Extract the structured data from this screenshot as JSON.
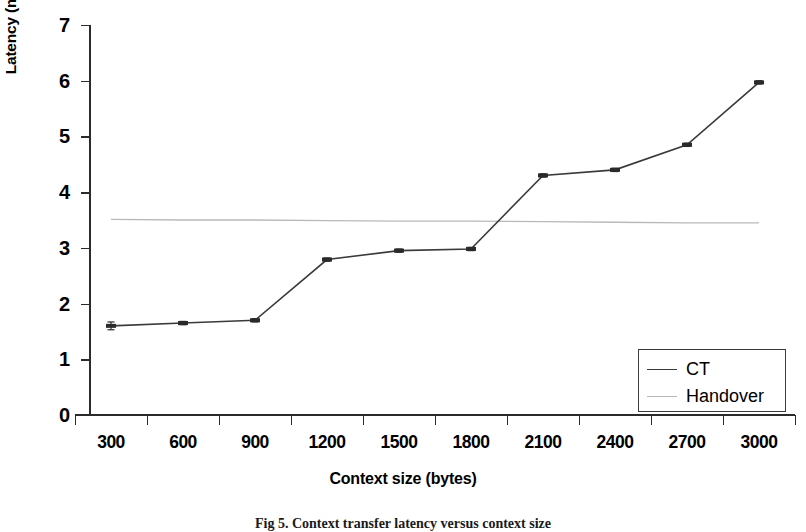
{
  "chart_data": {
    "type": "line",
    "title": "",
    "xlabel": "Context size (bytes)",
    "ylabel": "Latency (miliseconds)",
    "categories": [
      "300",
      "600",
      "900",
      "1200",
      "1500",
      "1800",
      "2100",
      "2400",
      "2700",
      "3000"
    ],
    "yticks": [
      "0",
      "1",
      "2",
      "3",
      "4",
      "5",
      "6",
      "7"
    ],
    "ylim": [
      0,
      7
    ],
    "grid": false,
    "legend_position": "inside-bottom-right",
    "series": [
      {
        "name": "CT",
        "color": "#3a3a3a",
        "values": [
          1.6,
          1.65,
          1.7,
          2.79,
          2.95,
          2.98,
          4.3,
          4.4,
          4.85,
          5.97
        ],
        "errors": [
          0.07,
          0.03,
          0.03,
          0.03,
          0.03,
          0.03,
          0.03,
          0.03,
          0.03,
          0.03
        ],
        "markers": true
      },
      {
        "name": "Handover",
        "color": "#b9b9b9",
        "values": [
          3.51,
          3.5,
          3.5,
          3.49,
          3.48,
          3.48,
          3.47,
          3.46,
          3.45,
          3.45
        ],
        "markers": false
      }
    ]
  },
  "axis": {
    "y_title": "Latency (miliseconds)",
    "x_title": "Context size (bytes)"
  },
  "legend": {
    "entries": [
      {
        "label": "CT",
        "color": "#3a3a3a"
      },
      {
        "label": "Handover",
        "color": "#b9b9b9"
      }
    ]
  },
  "caption": {
    "text": "Fig 5. Context transfer latency versus context size"
  },
  "colors": {
    "ct": "#3a3a3a",
    "handover": "#b9b9b9",
    "axis": "#2b2b2b",
    "background": "#ffffff"
  }
}
